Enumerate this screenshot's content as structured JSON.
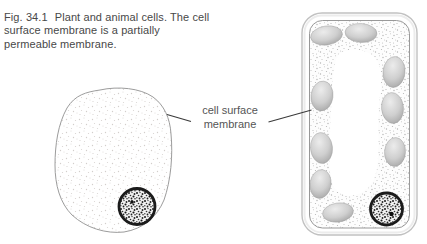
{
  "figure": {
    "fig_label": "Fig. 34.1",
    "caption_text": "Plant and animal cells. The cell surface membrane is a partially permeable membrane."
  },
  "labels": {
    "cell_surface_membrane": "cell surface membrane"
  },
  "diagram": {
    "shapes": [
      "animal-cell",
      "animal-cell-nucleus",
      "plant-cell-wall",
      "plant-cell-membrane",
      "plant-cell-vacuole",
      "chloroplast",
      "plant-cell-nucleus",
      "leader-line-left",
      "leader-line-right"
    ],
    "chloroplast_count": 9,
    "colors": {
      "background": "#ffffff",
      "caption_text": "#484848",
      "label_text": "#555555",
      "leader_line": "#3a3a3a",
      "animal_cell_outline": "#9c9c9c",
      "cell_wall_outline": "#c1c1c1",
      "membrane_line": "#8d8d8d",
      "chloroplast_gray": "#c0c0c0",
      "nucleus_dark": "#1b1b1b"
    }
  }
}
